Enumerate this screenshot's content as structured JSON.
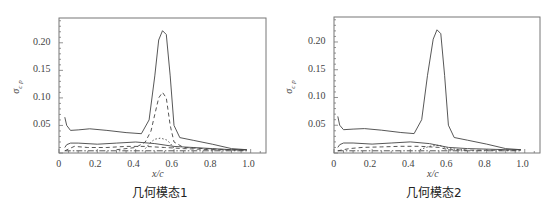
{
  "chart_data": [
    {
      "type": "line",
      "title": "",
      "caption": "几何模态1",
      "xlabel": "x/c",
      "ylabel": "σ_cp",
      "xlim": [
        0,
        1.08
      ],
      "ylim": [
        0,
        0.245
      ],
      "xticks": [
        "0",
        "0.2",
        "0.4",
        "0.6",
        "0.8",
        "1.0"
      ],
      "yticks": [
        "0.05",
        "0.10",
        "0.15",
        "0.20"
      ],
      "grid": false,
      "legend": null,
      "series": [
        {
          "name": "solid-upper",
          "style": "solid",
          "x": [
            0.03,
            0.04,
            0.06,
            0.1,
            0.16,
            0.25,
            0.35,
            0.43,
            0.47,
            0.5,
            0.52,
            0.54,
            0.56,
            0.58,
            0.6,
            0.63,
            0.7,
            0.8,
            0.9,
            0.98
          ],
          "y": [
            0.065,
            0.05,
            0.041,
            0.042,
            0.044,
            0.041,
            0.037,
            0.035,
            0.06,
            0.14,
            0.205,
            0.222,
            0.215,
            0.14,
            0.05,
            0.028,
            0.023,
            0.016,
            0.008,
            0.006
          ]
        },
        {
          "name": "solid-lower",
          "style": "solid",
          "x": [
            0.03,
            0.04,
            0.06,
            0.1,
            0.2,
            0.3,
            0.4,
            0.5,
            0.6,
            0.7,
            0.8,
            0.9,
            0.98
          ],
          "y": [
            0.01,
            0.015,
            0.018,
            0.018,
            0.016,
            0.018,
            0.02,
            0.017,
            0.012,
            0.01,
            0.008,
            0.006,
            0.006
          ]
        },
        {
          "name": "dashed-peak",
          "style": "dashed",
          "x": [
            0.3,
            0.4,
            0.45,
            0.48,
            0.5,
            0.52,
            0.54,
            0.56,
            0.58,
            0.6,
            0.65,
            0.8,
            0.98
          ],
          "y": [
            0.006,
            0.01,
            0.02,
            0.04,
            0.07,
            0.1,
            0.11,
            0.1,
            0.05,
            0.02,
            0.01,
            0.007,
            0.005
          ]
        },
        {
          "name": "dashed-lower",
          "style": "dashed",
          "x": [
            0.03,
            0.08,
            0.15,
            0.25,
            0.35,
            0.45,
            0.55,
            0.65,
            0.8,
            0.98
          ],
          "y": [
            0.004,
            0.012,
            0.01,
            0.01,
            0.012,
            0.012,
            0.01,
            0.008,
            0.006,
            0.005
          ]
        },
        {
          "name": "dotted-bump",
          "style": "dotted",
          "x": [
            0.45,
            0.48,
            0.5,
            0.53,
            0.56,
            0.58,
            0.6
          ],
          "y": [
            0.008,
            0.02,
            0.025,
            0.027,
            0.024,
            0.018,
            0.008
          ]
        },
        {
          "name": "dash-dot-baseline",
          "style": "dashdot",
          "x": [
            0.03,
            0.2,
            0.4,
            0.6,
            0.8,
            0.98
          ],
          "y": [
            0.004,
            0.004,
            0.004,
            0.004,
            0.004,
            0.004
          ]
        }
      ]
    },
    {
      "type": "line",
      "title": "",
      "caption": "几何模态2",
      "xlabel": "x/c",
      "ylabel": "σ_cp",
      "xlim": [
        0,
        1.08
      ],
      "ylim": [
        0,
        0.245
      ],
      "xticks": [
        "0",
        "0.2",
        "0.4",
        "0.6",
        "0.8",
        "1.0"
      ],
      "yticks": [
        "0.05",
        "0.10",
        "0.15",
        "0.20"
      ],
      "grid": false,
      "legend": null,
      "series": [
        {
          "name": "solid-upper",
          "style": "solid",
          "x": [
            0.02,
            0.03,
            0.05,
            0.1,
            0.16,
            0.25,
            0.35,
            0.42,
            0.46,
            0.49,
            0.52,
            0.54,
            0.56,
            0.58,
            0.6,
            0.63,
            0.7,
            0.8,
            0.9,
            0.98
          ],
          "y": [
            0.066,
            0.05,
            0.042,
            0.043,
            0.044,
            0.041,
            0.037,
            0.035,
            0.06,
            0.14,
            0.205,
            0.222,
            0.215,
            0.14,
            0.05,
            0.028,
            0.023,
            0.016,
            0.008,
            0.006
          ]
        },
        {
          "name": "solid-lower",
          "style": "solid",
          "x": [
            0.02,
            0.03,
            0.05,
            0.1,
            0.2,
            0.3,
            0.4,
            0.5,
            0.6,
            0.7,
            0.8,
            0.9,
            0.98
          ],
          "y": [
            0.01,
            0.015,
            0.018,
            0.018,
            0.016,
            0.018,
            0.02,
            0.017,
            0.01,
            0.008,
            0.007,
            0.006,
            0.006
          ]
        },
        {
          "name": "dashed-lower",
          "style": "dashed",
          "x": [
            0.02,
            0.08,
            0.15,
            0.25,
            0.35,
            0.45,
            0.55,
            0.6,
            0.7,
            0.8,
            0.98
          ],
          "y": [
            0.004,
            0.008,
            0.01,
            0.011,
            0.012,
            0.012,
            0.01,
            0.006,
            0.005,
            0.005,
            0.005
          ]
        },
        {
          "name": "dotted-bump",
          "style": "dotted",
          "x": [
            0.45,
            0.5,
            0.55,
            0.6,
            0.7
          ],
          "y": [
            0.006,
            0.012,
            0.014,
            0.008,
            0.005
          ]
        },
        {
          "name": "dash-dot-baseline",
          "style": "dashdot",
          "x": [
            0.02,
            0.2,
            0.4,
            0.6,
            0.8,
            0.98
          ],
          "y": [
            0.004,
            0.004,
            0.004,
            0.004,
            0.004,
            0.004
          ]
        }
      ]
    }
  ]
}
